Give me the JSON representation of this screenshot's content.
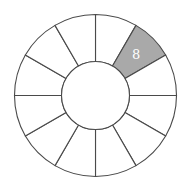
{
  "diagram": {
    "type": "ring",
    "segment_count": 12,
    "center": [
      95.5,
      95.5
    ],
    "outer_radius": 81,
    "inner_radius": 34,
    "colors": {
      "stroke": "#4a4a4a",
      "fill": "#ffffff",
      "shaded_fill": "#a9a9a9",
      "label_color": "#ffffff"
    },
    "segments": [
      {
        "index": 0,
        "start_deg": 0,
        "end_deg": 30,
        "shaded": false,
        "label": ""
      },
      {
        "index": 1,
        "start_deg": 30,
        "end_deg": 60,
        "shaded": true,
        "label": "8"
      },
      {
        "index": 2,
        "start_deg": 60,
        "end_deg": 90,
        "shaded": false,
        "label": ""
      },
      {
        "index": 3,
        "start_deg": 90,
        "end_deg": 120,
        "shaded": false,
        "label": ""
      },
      {
        "index": 4,
        "start_deg": 120,
        "end_deg": 150,
        "shaded": false,
        "label": ""
      },
      {
        "index": 5,
        "start_deg": 150,
        "end_deg": 180,
        "shaded": false,
        "label": ""
      },
      {
        "index": 6,
        "start_deg": 180,
        "end_deg": 210,
        "shaded": false,
        "label": ""
      },
      {
        "index": 7,
        "start_deg": 210,
        "end_deg": 240,
        "shaded": false,
        "label": ""
      },
      {
        "index": 8,
        "start_deg": 240,
        "end_deg": 270,
        "shaded": false,
        "label": ""
      },
      {
        "index": 9,
        "start_deg": 270,
        "end_deg": 300,
        "shaded": false,
        "label": ""
      },
      {
        "index": 10,
        "start_deg": 300,
        "end_deg": 330,
        "shaded": false,
        "label": ""
      },
      {
        "index": 11,
        "start_deg": 330,
        "end_deg": 360,
        "shaded": false,
        "label": ""
      }
    ]
  }
}
